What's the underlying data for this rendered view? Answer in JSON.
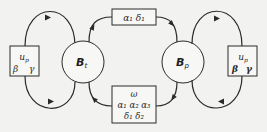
{
  "diagram": {
    "colors": {
      "background": "#f2f2f0",
      "stroke": "#2a2a2a",
      "box_fill": "#f7f7f5",
      "circle_fill": "#f7f7f5"
    },
    "nodes": {
      "bt": {
        "label": "B",
        "subscript": "t"
      },
      "bp": {
        "label": "B",
        "subscript": "p"
      }
    },
    "boxes": {
      "left": {
        "line1": "u",
        "line1_sub": "p",
        "line2a": "β",
        "line2b": "γ"
      },
      "right": {
        "line1": "u",
        "line1_sub": "p",
        "line2a": "β",
        "line2b": "γ"
      },
      "top": {
        "text": "α₁  δ₁"
      },
      "bottom": {
        "line1": "ω",
        "line2": "α₁ α₂ α₃",
        "line3": "δ₁  δ₂"
      }
    },
    "edges": [
      {
        "from": "bt",
        "to": "left-box",
        "path": "upper loop"
      },
      {
        "from": "left-box",
        "to": "bt",
        "path": "lower loop"
      },
      {
        "from": "bt",
        "to": "top-box"
      },
      {
        "from": "top-box",
        "to": "bp"
      },
      {
        "from": "bp",
        "to": "bottom-box"
      },
      {
        "from": "bottom-box",
        "to": "bt"
      },
      {
        "from": "bp",
        "to": "right-box",
        "path": "upper loop"
      },
      {
        "from": "right-box",
        "to": "bp",
        "path": "lower loop"
      }
    ]
  }
}
